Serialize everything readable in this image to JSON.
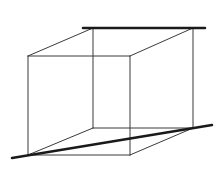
{
  "diagram": {
    "type": "wireframe-cube",
    "background": "#ffffff",
    "thin_stroke": "#3a3a3a",
    "thin_width": 1,
    "bold_stroke": "#1a1a1a",
    "bold_width": 2.5,
    "front_face": {
      "top_left": [
        28,
        56
      ],
      "top_right": [
        130,
        56
      ],
      "bottom_right": [
        130,
        155
      ],
      "bottom_left": [
        28,
        155
      ]
    },
    "back_face": {
      "top_left": [
        93,
        28
      ],
      "top_right": [
        193,
        28
      ],
      "bottom_right": [
        193,
        128
      ],
      "bottom_left": [
        93,
        128
      ]
    },
    "bold_lines": [
      {
        "name": "top-horizontal-line",
        "from": [
          83,
          28
        ],
        "to": [
          205,
          28
        ]
      },
      {
        "name": "bottom-diagonal-line",
        "from": [
          12,
          158
        ],
        "to": [
          212,
          125
        ]
      }
    ]
  }
}
